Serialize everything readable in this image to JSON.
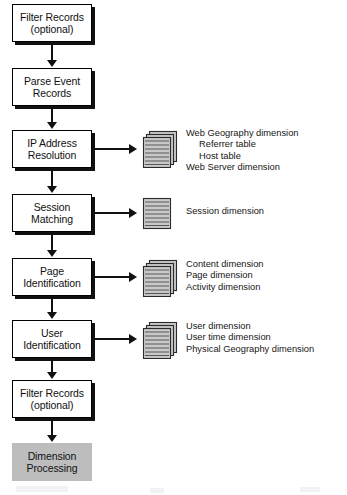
{
  "diagram": {
    "accent_shaded": "#bdbdbd",
    "line_color": "#111111",
    "icon_fill": "#c8c8c8",
    "steps": [
      {
        "id": "filter-records-top",
        "line1": "Filter Records",
        "line2": "(optional)",
        "shaded": false
      },
      {
        "id": "parse-event-records",
        "line1": "Parse Event",
        "line2": "Records",
        "shaded": false
      },
      {
        "id": "ip-address-resolution",
        "line1": "IP Address",
        "line2": "Resolution",
        "shaded": false
      },
      {
        "id": "session-matching",
        "line1": "Session",
        "line2": "Matching",
        "shaded": false
      },
      {
        "id": "page-identification",
        "line1": "Page",
        "line2": "Identification",
        "shaded": false
      },
      {
        "id": "user-identification",
        "line1": "User",
        "line2": "Identification",
        "shaded": false
      },
      {
        "id": "filter-records-bottom",
        "line1": "Filter Records",
        "line2": "(optional)",
        "shaded": false
      },
      {
        "id": "dimension-processing",
        "line1": "Dimension",
        "line2": "Processing",
        "shaded": true
      }
    ],
    "outputs": [
      {
        "id": "ip-address-outputs",
        "icon": "document-stack-icon",
        "pages": 3,
        "labels": [
          {
            "text": "Web Geography dimension",
            "indent": false
          },
          {
            "text": "Referrer table",
            "indent": true
          },
          {
            "text": "Host table",
            "indent": true
          },
          {
            "text": "Web Server dimension",
            "indent": false
          }
        ]
      },
      {
        "id": "session-matching-outputs",
        "icon": "document-single-icon",
        "pages": 1,
        "labels": [
          {
            "text": "Session dimension",
            "indent": false
          }
        ]
      },
      {
        "id": "page-identification-outputs",
        "icon": "document-stack-icon",
        "pages": 3,
        "labels": [
          {
            "text": "Content dimension",
            "indent": false
          },
          {
            "text": "Page dimension",
            "indent": false
          },
          {
            "text": "Activity dimension",
            "indent": false
          }
        ]
      },
      {
        "id": "user-identification-outputs",
        "icon": "document-stack-icon",
        "pages": 3,
        "labels": [
          {
            "text": "User dimension",
            "indent": false
          },
          {
            "text": "User time dimension",
            "indent": false
          },
          {
            "text": "Physical Geography dimension",
            "indent": false
          }
        ]
      }
    ]
  }
}
